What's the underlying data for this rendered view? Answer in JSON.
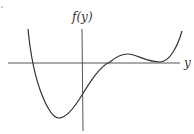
{
  "diagram": {
    "type": "function-graph",
    "vertical_axis_label": "f(y)",
    "horizontal_axis_label": "y",
    "colors": {
      "axis": "#555555",
      "curve": "#333333",
      "label": "#333333"
    },
    "curve_points": [
      [
        28,
        29
      ],
      [
        32,
        63
      ],
      [
        59,
        118
      ],
      [
        82,
        95
      ],
      [
        110,
        63
      ],
      [
        127,
        54
      ],
      [
        160,
        62
      ],
      [
        182,
        31
      ]
    ],
    "features": {
      "roots": [
        [
          32,
          63
        ],
        [
          110,
          63
        ],
        [
          160,
          63
        ]
      ],
      "local_minima": [
        [
          59,
          118
        ],
        [
          160,
          62
        ]
      ],
      "local_maxima": [
        [
          127,
          54
        ]
      ],
      "y_intercept": [
        82,
        95
      ]
    }
  }
}
